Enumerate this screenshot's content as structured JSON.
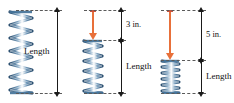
{
  "figure": {
    "colors": {
      "spring": "#3f6f96",
      "spring_highlight": "#ffffff",
      "force_arrow": "#e8703a",
      "dimension_line": "#1a1a1a",
      "dashed_line": "#5a5a5a",
      "background": "#ffffff"
    }
  },
  "panels": [
    {
      "id": "panel-free",
      "name": "free-spring",
      "length_label": "Length",
      "compression_label": "",
      "has_force_arrow": false,
      "coils": 12,
      "spring_top": 11,
      "spring_bottom": 93
    },
    {
      "id": "panel-compressed-3",
      "name": "spring-compressed-3in",
      "length_label": "Length",
      "compression_label": "3 in.",
      "has_force_arrow": true,
      "coils": 10,
      "spring_top": 40,
      "spring_bottom": 93
    },
    {
      "id": "panel-compressed-5",
      "name": "spring-compressed-5in",
      "length_label": "Length",
      "compression_label": "5 in.",
      "has_force_arrow": true,
      "coils": 9,
      "spring_top": 60,
      "spring_bottom": 93
    }
  ]
}
